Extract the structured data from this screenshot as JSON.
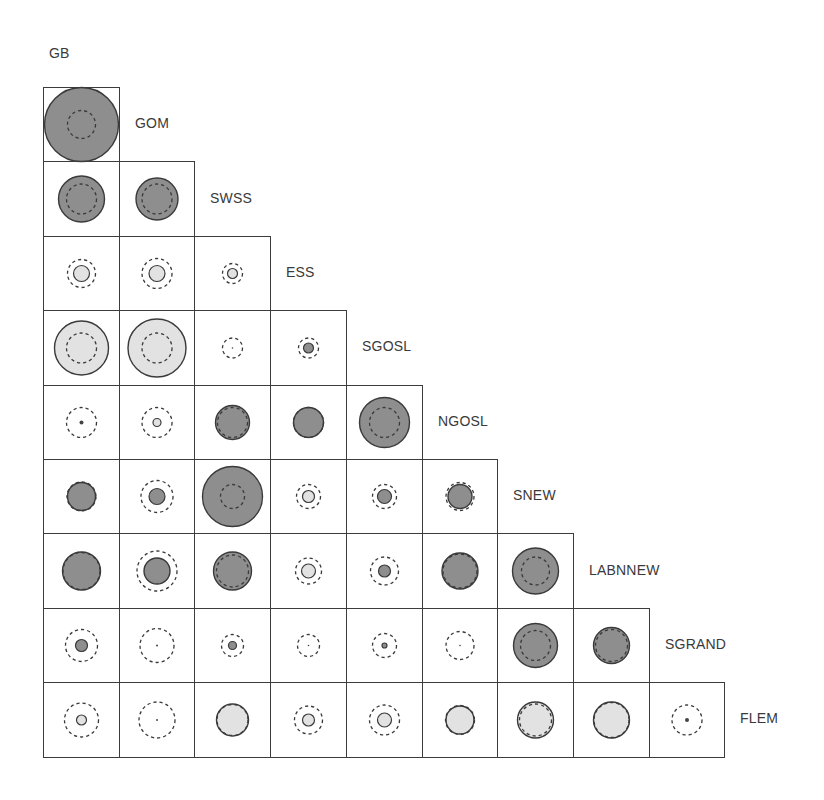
{
  "diagram": {
    "title_label": "GB",
    "row_labels": [
      "GOM",
      "SWSS",
      "ESS",
      "SGOSL",
      "NGOSL",
      "SNEW",
      "LABNNEW",
      "SGRAND",
      "FLEM"
    ],
    "column_labels": [
      "GB",
      "GOM",
      "SWSS",
      "ESS",
      "SGOSL",
      "NGOSL",
      "SNEW",
      "LABNNEW",
      "SGRAND"
    ],
    "colors": {
      "dark_fill": "#8e8e8e",
      "light_fill": "#e2e2e2",
      "stroke": "#3a3a3a",
      "grid": "#3c3c3c",
      "text": "#3a3a3a"
    },
    "legend_note": "Solid circle = observed value (dark = positive, light = negative); dashed circle = reference/expected value",
    "cells": [
      [
        {
          "fill": "dark",
          "r": 37,
          "dash": 14
        }
      ],
      [
        {
          "fill": "dark",
          "r": 23,
          "dash": 15
        },
        {
          "fill": "dark",
          "r": 21,
          "dash": 15
        }
      ],
      [
        {
          "fill": "light",
          "r": 8,
          "dash": 14
        },
        {
          "fill": "light",
          "r": 8,
          "dash": 15
        },
        {
          "fill": "light",
          "r": 5,
          "dash": 10
        }
      ],
      [
        {
          "fill": "light",
          "r": 27,
          "dash": 15
        },
        {
          "fill": "light",
          "r": 29,
          "dash": 15
        },
        {
          "fill": "dot",
          "r": 0.6,
          "dash": 10
        },
        {
          "fill": "dark",
          "r": 5,
          "dash": 10
        }
      ],
      [
        {
          "fill": "dot",
          "r": 2,
          "dash": 15
        },
        {
          "fill": "light",
          "r": 4,
          "dash": 15
        },
        {
          "fill": "dark",
          "r": 17,
          "dash": 15
        },
        {
          "fill": "dark",
          "r": 15,
          "dash": 15
        },
        {
          "fill": "dark",
          "r": 25,
          "dash": 15
        }
      ],
      [
        {
          "fill": "dark",
          "r": 14,
          "dash": 14.5
        },
        {
          "fill": "dark",
          "r": 8,
          "dash": 16
        },
        {
          "fill": "dark",
          "r": 30,
          "dash": 12
        },
        {
          "fill": "light",
          "r": 6,
          "dash": 12
        },
        {
          "fill": "dark",
          "r": 7,
          "dash": 12
        },
        {
          "fill": "dark",
          "r": 12,
          "dash": 14
        }
      ],
      [
        {
          "fill": "dark",
          "r": 19,
          "dash": 18.5
        },
        {
          "fill": "dark",
          "r": 13,
          "dash": 20
        },
        {
          "fill": "dark",
          "r": 19,
          "dash": 16
        },
        {
          "fill": "light",
          "r": 7,
          "dash": 13
        },
        {
          "fill": "dark",
          "r": 6,
          "dash": 14
        },
        {
          "fill": "dark",
          "r": 18,
          "dash": 17
        },
        {
          "fill": "dark",
          "r": 23,
          "dash": 14
        }
      ],
      [
        {
          "fill": "dark",
          "r": 6,
          "dash": 16
        },
        {
          "fill": "dot",
          "r": 1,
          "dash": 17
        },
        {
          "fill": "dark",
          "r": 4,
          "dash": 11
        },
        {
          "fill": "dot",
          "r": 0.6,
          "dash": 11
        },
        {
          "fill": "dark",
          "r": 2.5,
          "dash": 12
        },
        {
          "fill": "dot",
          "r": 0.6,
          "dash": 14
        },
        {
          "fill": "dark",
          "r": 22,
          "dash": 15
        },
        {
          "fill": "dark",
          "r": 18,
          "dash": 16
        }
      ],
      [
        {
          "fill": "light",
          "r": 5,
          "dash": 17
        },
        {
          "fill": "dot",
          "r": 1,
          "dash": 18
        },
        {
          "fill": "light",
          "r": 16,
          "dash": 15.5
        },
        {
          "fill": "light",
          "r": 6,
          "dash": 14
        },
        {
          "fill": "light",
          "r": 7,
          "dash": 15
        },
        {
          "fill": "light",
          "r": 14,
          "dash": 14.5
        },
        {
          "fill": "light",
          "r": 18,
          "dash": 16
        },
        {
          "fill": "light",
          "r": 18,
          "dash": 17.5
        },
        {
          "fill": "dot",
          "r": 2,
          "dash": 15
        }
      ]
    ]
  },
  "layout": {
    "origin_x": 43,
    "origin_y": 87,
    "cell_w": 75.7,
    "cell_h": 74.4
  }
}
